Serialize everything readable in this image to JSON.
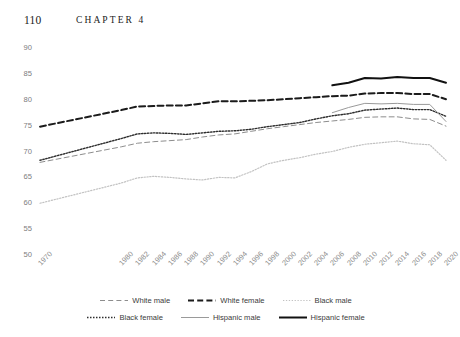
{
  "running_head": {
    "folio": "110",
    "chapter": "CHAPTER 4"
  },
  "chart_data": {
    "type": "line",
    "title": "",
    "subtitle": "",
    "xlabel": "",
    "ylabel": "",
    "xlim": [
      1970,
      2020
    ],
    "ylim": [
      50,
      90
    ],
    "grid": false,
    "legend_position": "bottom",
    "x": [
      1970,
      1980,
      1982,
      1984,
      1986,
      1988,
      1990,
      1992,
      1994,
      1996,
      1998,
      2000,
      2002,
      2004,
      2006,
      2008,
      2010,
      2012,
      2014,
      2016,
      2018,
      2020
    ],
    "xtick_labels": [
      "1970",
      "1980",
      "1982",
      "1984",
      "1986",
      "1988",
      "1990",
      "1992",
      "1994",
      "1996",
      "1998",
      "2000",
      "2002",
      "2004",
      "2006",
      "2008",
      "2010",
      "2012",
      "2014",
      "2016",
      "2018",
      "2020"
    ],
    "ytick_labels": [
      "50",
      "55",
      "60",
      "65",
      "70",
      "75",
      "80",
      "85",
      "90"
    ],
    "ytick_values": [
      50,
      55,
      60,
      65,
      70,
      75,
      80,
      85,
      90
    ],
    "series": [
      {
        "name": "White male",
        "style": "dashed",
        "color": "#8d8d8d",
        "width": 1.0,
        "x": [
          1970,
          1980,
          1982,
          1984,
          1986,
          1988,
          1990,
          1992,
          1994,
          1996,
          1998,
          2000,
          2002,
          2004,
          2006,
          2008,
          2010,
          2012,
          2014,
          2016,
          2018,
          2020
        ],
        "values": [
          67.9,
          70.9,
          71.6,
          71.9,
          72.1,
          72.3,
          72.8,
          73.2,
          73.4,
          73.9,
          74.4,
          74.8,
          75.2,
          75.6,
          75.9,
          76.2,
          76.6,
          76.7,
          76.7,
          76.3,
          76.2,
          74.9
        ]
      },
      {
        "name": "White female",
        "style": "dashed",
        "color": "#1b1b1b",
        "width": 2.0,
        "x": [
          1970,
          1980,
          1982,
          1984,
          1986,
          1988,
          1990,
          1992,
          1994,
          1996,
          1998,
          2000,
          2002,
          2004,
          2006,
          2008,
          2010,
          2012,
          2014,
          2016,
          2018,
          2020
        ],
        "values": [
          74.8,
          78.0,
          78.7,
          78.8,
          78.9,
          78.9,
          79.3,
          79.7,
          79.7,
          79.8,
          79.9,
          80.1,
          80.3,
          80.5,
          80.7,
          80.8,
          81.2,
          81.3,
          81.3,
          81.1,
          81.1,
          80.1
        ]
      },
      {
        "name": "Black male",
        "style": "dotted",
        "color": "#c2c2c2",
        "width": 1.2,
        "x": [
          1970,
          1980,
          1982,
          1984,
          1986,
          1988,
          1990,
          1992,
          1994,
          1996,
          1998,
          2000,
          2002,
          2004,
          2006,
          2008,
          2010,
          2012,
          2014,
          2016,
          2018,
          2020
        ],
        "values": [
          60.0,
          63.9,
          64.9,
          65.2,
          65.0,
          64.7,
          64.5,
          65.0,
          64.9,
          66.1,
          67.6,
          68.3,
          68.8,
          69.5,
          70.0,
          70.8,
          71.4,
          71.7,
          72.0,
          71.5,
          71.3,
          68.3
        ]
      },
      {
        "name": "Black female",
        "style": "dotted",
        "color": "#2e2e2e",
        "width": 1.4,
        "x": [
          1970,
          1980,
          1982,
          1984,
          1986,
          1988,
          1990,
          1992,
          1994,
          1996,
          1998,
          2000,
          2002,
          2004,
          2006,
          2008,
          2010,
          2012,
          2014,
          2016,
          2018,
          2020
        ],
        "values": [
          68.3,
          72.5,
          73.4,
          73.6,
          73.5,
          73.3,
          73.6,
          73.9,
          74.0,
          74.3,
          74.8,
          75.2,
          75.6,
          76.3,
          76.9,
          77.3,
          78.0,
          78.2,
          78.4,
          78.1,
          78.1,
          76.8
        ]
      },
      {
        "name": "Hispanic male",
        "style": "solid",
        "color": "#9a9a9a",
        "width": 1.0,
        "x": [
          2006,
          2008,
          2010,
          2012,
          2014,
          2016,
          2018,
          2020
        ],
        "values": [
          77.5,
          78.5,
          79.3,
          79.2,
          79.3,
          79.1,
          79.1,
          75.8
        ]
      },
      {
        "name": "Hispanic female",
        "style": "solid",
        "color": "#111111",
        "width": 2.0,
        "x": [
          2006,
          2008,
          2010,
          2012,
          2014,
          2016,
          2018,
          2020
        ],
        "values": [
          82.8,
          83.3,
          84.2,
          84.1,
          84.4,
          84.2,
          84.2,
          83.3
        ]
      }
    ]
  },
  "legend": {
    "rows": [
      [
        {
          "label": "White male",
          "key": "white-male"
        },
        {
          "label": "White female",
          "key": "white-female"
        },
        {
          "label": "Black male",
          "key": "black-male"
        }
      ],
      [
        {
          "label": "Black female",
          "key": "black-female"
        },
        {
          "label": "Hispanic male",
          "key": "hispanic-male"
        },
        {
          "label": "Hispanic female",
          "key": "hispanic-female"
        }
      ]
    ]
  }
}
